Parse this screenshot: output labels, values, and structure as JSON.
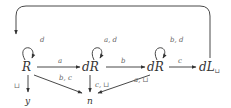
{
  "diagram": {
    "type": "state-transition-graph",
    "nodes": [
      {
        "id": "R",
        "label": "R",
        "x": 28,
        "y": 71
      },
      {
        "id": "dR1",
        "label": "dR",
        "x": 94,
        "y": 71
      },
      {
        "id": "dR2",
        "label": "dR",
        "x": 157,
        "y": 71
      },
      {
        "id": "dL",
        "label": "dL",
        "sub": "⊔",
        "x": 210,
        "y": 71
      },
      {
        "id": "y",
        "label": "y",
        "x": 28,
        "y": 101
      },
      {
        "id": "n",
        "label": "n",
        "x": 90,
        "y": 101
      }
    ],
    "edges": [
      {
        "from": "R",
        "to": "R",
        "label": "d",
        "kind": "self-loop"
      },
      {
        "from": "dR1",
        "to": "dR1",
        "label": "a, d",
        "kind": "self-loop"
      },
      {
        "from": "dR2",
        "to": "dR2",
        "label": "b, d",
        "kind": "self-loop"
      },
      {
        "from": "R",
        "to": "dR1",
        "label": "a"
      },
      {
        "from": "dR1",
        "to": "dR2",
        "label": "b"
      },
      {
        "from": "dR2",
        "to": "dL",
        "label": "c"
      },
      {
        "from": "dL",
        "to": "R",
        "label": "",
        "kind": "feedback-arc"
      },
      {
        "from": "R",
        "to": "y",
        "label": "⊔"
      },
      {
        "from": "R",
        "to": "n",
        "label": "b, c"
      },
      {
        "from": "dR1",
        "to": "n",
        "label": "c, ⊔"
      },
      {
        "from": "dR2",
        "to": "n",
        "label": "a, ⊔"
      }
    ]
  }
}
